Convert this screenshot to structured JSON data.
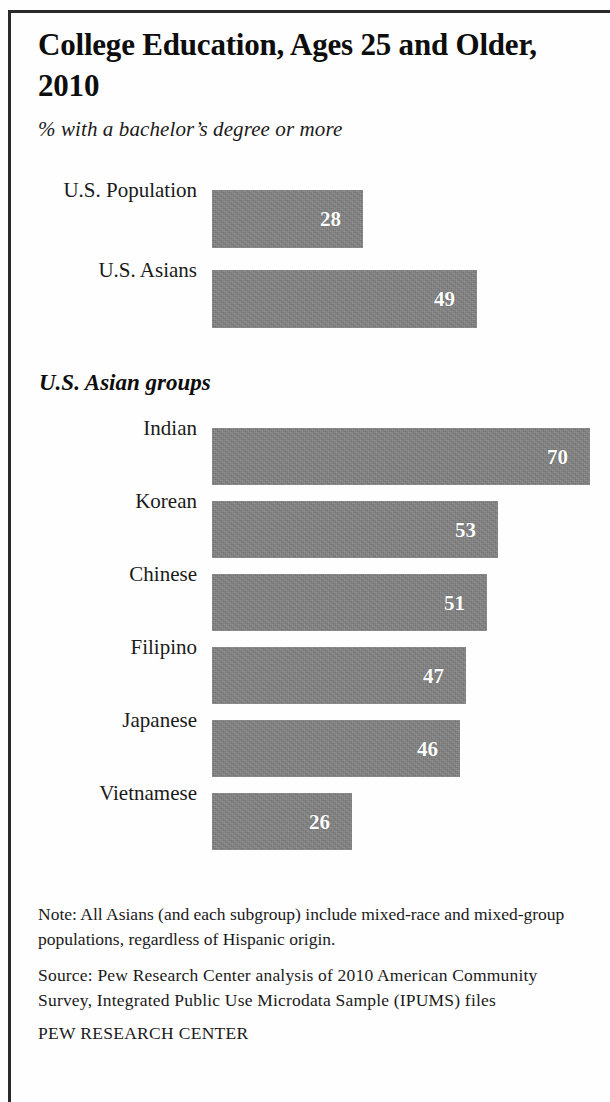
{
  "title": "College Education, Ages 25 and Older, 2010",
  "subtitle": "% with a bachelor’s degree or more",
  "section_header": "U.S. Asian groups",
  "notes": {
    "note": "Note: All Asians (and each subgroup) include mixed-race and mixed-group populations, regardless of Hispanic origin.",
    "source": "Source: Pew Research Center analysis of 2010 American Community Survey, Integrated Public Use Microdata Sample (IPUMS) files",
    "credit": "PEW RESEARCH CENTER"
  },
  "colors": {
    "bar_fill": "#808080",
    "text": "#1a1a1a",
    "value_label": "#ffffff",
    "rule": "#2a2a2a",
    "background": "#fefefe"
  },
  "chart_data": {
    "type": "bar",
    "orientation": "horizontal",
    "title": "College Education, Ages 25 and Older, 2010",
    "subtitle": "% with a bachelor’s degree or more",
    "xlabel": "",
    "ylabel": "",
    "unit": "percent",
    "xlim": [
      0,
      70
    ],
    "grid": false,
    "legend": false,
    "value_labels": true,
    "groups": [
      {
        "name": "",
        "categories": [
          "U.S. Population",
          "U.S. Asians"
        ],
        "values": [
          28,
          49
        ]
      },
      {
        "name": "U.S. Asian groups",
        "categories": [
          "Indian",
          "Korean",
          "Chinese",
          "Filipino",
          "Japanese",
          "Vietnamese"
        ],
        "values": [
          70,
          53,
          51,
          47,
          46,
          26
        ]
      }
    ],
    "categories": [
      "U.S. Population",
      "U.S. Asians",
      "Indian",
      "Korean",
      "Chinese",
      "Filipino",
      "Japanese",
      "Vietnamese"
    ],
    "values": [
      28,
      49,
      70,
      53,
      51,
      47,
      46,
      26
    ]
  },
  "bars": [
    {
      "label": "U.S. Population",
      "value": 28,
      "value_text": "28",
      "top": 190,
      "height": 58
    },
    {
      "label": "U.S. Asians",
      "value": 49,
      "value_text": "49",
      "top": 270,
      "height": 58
    },
    {
      "label": "Indian",
      "value": 70,
      "value_text": "70",
      "top": 428,
      "height": 57
    },
    {
      "label": "Korean",
      "value": 53,
      "value_text": "53",
      "top": 501,
      "height": 57
    },
    {
      "label": "Chinese",
      "value": 51,
      "value_text": "51",
      "top": 574,
      "height": 57
    },
    {
      "label": "Filipino",
      "value": 47,
      "value_text": "47",
      "top": 647,
      "height": 57
    },
    {
      "label": "Japanese",
      "value": 46,
      "value_text": "46",
      "top": 720,
      "height": 57
    },
    {
      "label": "Vietnamese",
      "value": 26,
      "value_text": "26",
      "top": 793,
      "height": 57
    }
  ],
  "scale": {
    "px_per_unit": 5.4,
    "origin_x": 212
  }
}
